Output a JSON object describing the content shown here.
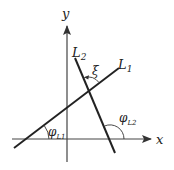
{
  "diagram": {
    "axes": {
      "x_label": "x",
      "y_label": "y"
    },
    "lines": [
      {
        "id": "L1",
        "label": "L",
        "subscript": "1"
      },
      {
        "id": "L2",
        "label": "L",
        "subscript": "2"
      }
    ],
    "angles": {
      "xi": "ξ",
      "phi_L1": {
        "symbol": "φ",
        "subscript": "L1"
      },
      "phi_L2": {
        "symbol": "φ",
        "subscript": "L2"
      }
    },
    "colors": {
      "stroke": "#222222",
      "background": "#ffffff"
    }
  }
}
